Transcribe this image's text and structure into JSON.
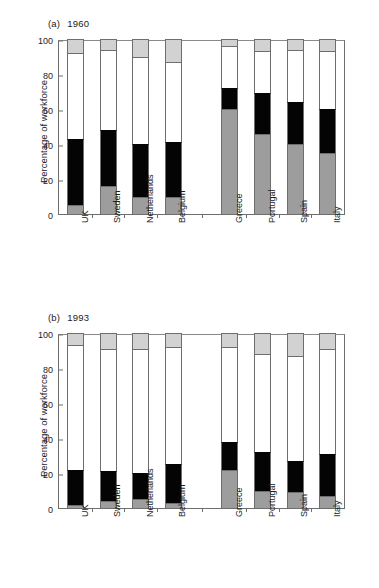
{
  "figure": {
    "panels": [
      {
        "id": "a",
        "tag": "(a)",
        "year": "1960"
      },
      {
        "id": "b",
        "tag": "(b)",
        "year": "1993"
      }
    ]
  },
  "axes": {
    "ylabel": "Percentage of workforce",
    "yticks": [
      "0",
      "20",
      "40",
      "60",
      "80",
      "100"
    ],
    "ylim": [
      0,
      100
    ]
  },
  "colors": {
    "agriculture": "#9d9d9d",
    "industry": "#040404",
    "services": "#ffffff",
    "other": "#d2d2d2",
    "frame": "#6e6e6e",
    "text": "#1c1c1c",
    "background": "#ffffff"
  },
  "chart_data": [
    {
      "type": "bar",
      "title": "(a) 1960",
      "xlabel": "",
      "ylabel": "Percentage of workforce",
      "ylim": [
        0,
        100
      ],
      "grid": false,
      "legend": "none",
      "stacked": true,
      "categories": [
        "UK",
        "Sweden",
        "Netherlands",
        "Belgium",
        "Greece",
        "Portugal",
        "Spain",
        "Italy"
      ],
      "group_gap_after": "Belgium",
      "series": [
        {
          "name": "Agriculture",
          "color": "#9d9d9d",
          "values": [
            5,
            16,
            10,
            10,
            60,
            46,
            40,
            35
          ]
        },
        {
          "name": "Industry",
          "color": "#040404",
          "values": [
            38,
            32,
            30,
            31,
            12,
            23,
            24,
            25
          ]
        },
        {
          "name": "Services",
          "color": "#ffffff",
          "values": [
            49,
            46,
            50,
            46,
            24,
            24,
            30,
            33
          ]
        },
        {
          "name": "Other",
          "color": "#d2d2d2",
          "values": [
            8,
            6,
            10,
            13,
            4,
            7,
            6,
            7
          ]
        }
      ],
      "cumulative_tops": {
        "UK": [
          5,
          43,
          92,
          100
        ],
        "Sweden": [
          16,
          48,
          94,
          100
        ],
        "Netherlands": [
          10,
          40,
          90,
          100
        ],
        "Belgium": [
          10,
          41,
          87,
          100
        ],
        "Greece": [
          60,
          72,
          96,
          100
        ],
        "Portugal": [
          46,
          69,
          93,
          100
        ],
        "Spain": [
          40,
          64,
          94,
          100
        ],
        "Italy": [
          35,
          60,
          93,
          100
        ]
      }
    },
    {
      "type": "bar",
      "title": "(b) 1993",
      "xlabel": "",
      "ylabel": "Percentage of workforce",
      "ylim": [
        0,
        100
      ],
      "grid": false,
      "legend": "none",
      "stacked": true,
      "categories": [
        "UK",
        "Sweden",
        "Netherlands",
        "Belgium",
        "Greece",
        "Portugal",
        "Spain",
        "Italy"
      ],
      "group_gap_after": "Belgium",
      "series": [
        {
          "name": "Agriculture",
          "color": "#9d9d9d",
          "values": [
            2,
            4,
            5,
            3,
            22,
            10,
            9,
            7
          ]
        },
        {
          "name": "Industry",
          "color": "#040404",
          "values": [
            20,
            17,
            15,
            22,
            16,
            22,
            18,
            24
          ]
        },
        {
          "name": "Services",
          "color": "#ffffff",
          "values": [
            71,
            70,
            71,
            67,
            54,
            56,
            60,
            60
          ]
        },
        {
          "name": "Other",
          "color": "#d2d2d2",
          "values": [
            7,
            9,
            9,
            8,
            8,
            12,
            13,
            9
          ]
        }
      ],
      "cumulative_tops": {
        "UK": [
          2,
          22,
          93,
          100
        ],
        "Sweden": [
          4,
          21,
          91,
          100
        ],
        "Netherlands": [
          5,
          20,
          91,
          100
        ],
        "Belgium": [
          3,
          25,
          92,
          100
        ],
        "Greece": [
          22,
          38,
          92,
          100
        ],
        "Portugal": [
          10,
          32,
          88,
          100
        ],
        "Spain": [
          9,
          27,
          87,
          100
        ],
        "Italy": [
          7,
          31,
          91,
          100
        ]
      }
    }
  ]
}
